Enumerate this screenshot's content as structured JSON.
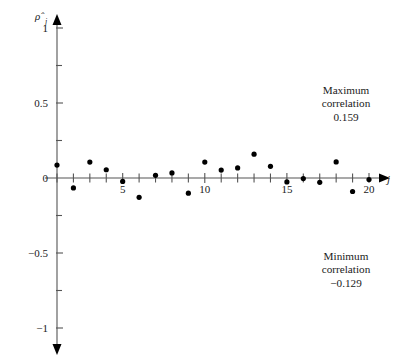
{
  "chart_data": {
    "type": "scatter",
    "title": "",
    "xlabel": "j",
    "ylabel": "ρ̂",
    "ylabel_sub": "j",
    "xlim": [
      0,
      21
    ],
    "ylim": [
      -1,
      1
    ],
    "grid": false,
    "legend": "none",
    "x_ticks_major": [
      5,
      10,
      15,
      20
    ],
    "x_ticks_major_labels": [
      "5",
      "10",
      "15",
      "20"
    ],
    "x_ticks_minor": [
      1,
      2,
      3,
      4,
      6,
      7,
      8,
      9,
      11,
      12,
      13,
      14,
      16,
      17,
      18,
      19
    ],
    "y_ticks_major": [
      -1,
      -0.5,
      0,
      0.5,
      1
    ],
    "y_ticks_major_labels": [
      "−1",
      "−0.5",
      "0",
      "0.5",
      "1"
    ],
    "y_ticks_minor": [
      -0.75,
      -0.25,
      0.25,
      0.75
    ],
    "x": [
      1,
      2,
      3,
      4,
      5,
      6,
      7,
      8,
      9,
      10,
      11,
      12,
      13,
      14,
      15,
      16,
      17,
      18,
      19,
      20
    ],
    "values": [
      0.086,
      -0.066,
      0.106,
      0.055,
      -0.023,
      -0.129,
      0.018,
      0.034,
      -0.101,
      0.106,
      0.053,
      0.067,
      0.159,
      0.078,
      -0.026,
      -0.004,
      -0.029,
      0.107,
      -0.09,
      -0.01
    ],
    "series": [
      {
        "name": "sample autocorrelation",
        "values": [
          0.086,
          -0.066,
          0.106,
          0.055,
          -0.023,
          -0.129,
          0.018,
          0.034,
          -0.101,
          0.106,
          0.053,
          0.067,
          0.159,
          0.078,
          -0.026,
          -0.004,
          -0.029,
          0.107,
          -0.09,
          -0.01
        ]
      }
    ],
    "annotations": [
      {
        "id": "maximum",
        "line1": "Maximum",
        "line2": "correlation",
        "line3": "0.159",
        "value": 0.159
      },
      {
        "id": "minimum",
        "line1": "Minimum",
        "line2": "correlation",
        "line3": "−0.129",
        "value": -0.129
      }
    ],
    "colors": {
      "axis": "#555555",
      "point": "#000000",
      "text": "#1a1a1a",
      "background": "#ffffff"
    }
  }
}
